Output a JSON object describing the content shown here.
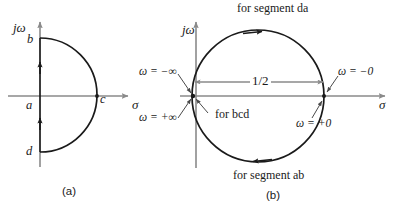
{
  "figure": {
    "panel_a": {
      "caption": "(a)",
      "axis_imag": "jω",
      "axis_real": "σ",
      "point_b": "b",
      "point_a": "a",
      "point_c": "c",
      "point_d": "d"
    },
    "panel_b": {
      "caption": "(b)",
      "axis_imag": "jω",
      "axis_real": "σ",
      "label_top": "for segment da",
      "label_bottom": "for segment ab",
      "label_bcd": "for bcd",
      "label_diameter": "1/2",
      "label_omega_minus_inf": "ω = −∞",
      "label_omega_plus_inf": "ω = +∞",
      "label_omega_minus_zero": "ω = −0",
      "label_omega_plus_zero": "ω = +0"
    },
    "colors": {
      "ink": "#1a1a1a",
      "axis": "#8a8a8a",
      "curve": "#1a1a1a",
      "background": "#ffffff"
    }
  }
}
